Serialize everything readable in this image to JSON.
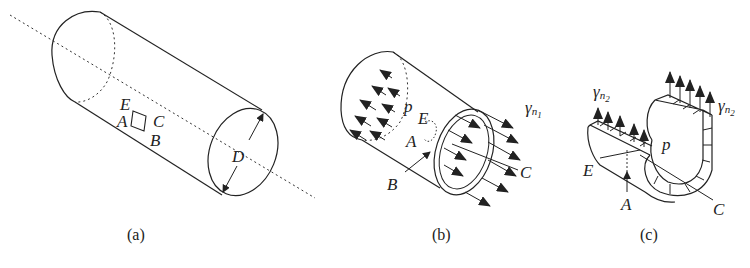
{
  "figure": {
    "panels": [
      {
        "id": "a",
        "caption": "(a)",
        "labels": {
          "E": "E",
          "A": "A",
          "B": "B",
          "C": "C",
          "D": "D"
        }
      },
      {
        "id": "b",
        "caption": "(b)",
        "labels": {
          "E": "E",
          "A": "A",
          "B": "B",
          "C": "C",
          "p": "p",
          "gamma": "γ",
          "n": "n",
          "sub": "1"
        }
      },
      {
        "id": "c",
        "caption": "(c)",
        "labels": {
          "E": "E",
          "A": "A",
          "C": "C",
          "p": "p",
          "gamma_left": "γ",
          "n_left": "n",
          "sub_left": "2",
          "gamma_right": "γ",
          "n_right": "n",
          "sub_right": "2"
        }
      }
    ]
  }
}
